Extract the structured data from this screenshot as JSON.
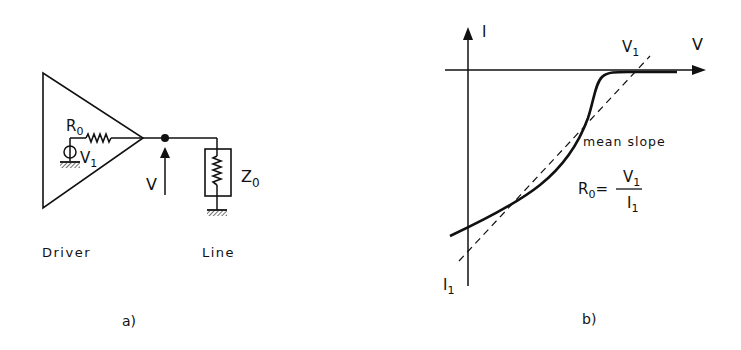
{
  "figure_a": {
    "caption": "a)",
    "driver_label": "Driver",
    "line_label": "Line",
    "resistor_label": "R",
    "resistor_sub": "0",
    "source_label": "V",
    "source_sub": "1",
    "voltage_label": "V",
    "impedance_label": "Z",
    "impedance_sub": "0"
  },
  "figure_b": {
    "caption": "b)",
    "y_axis_label": "I",
    "x_axis_label": "V",
    "v1_label": "V",
    "v1_sub": "1",
    "i1_label": "I",
    "i1_sub": "1",
    "annotation": "mean slope",
    "formula_lhs": "R",
    "formula_lhs_sub": "0",
    "formula_eq": "=",
    "formula_num": "V",
    "formula_num_sub": "1",
    "formula_den": "I",
    "formula_den_sub": "1"
  },
  "colors": {
    "ink": "#111111",
    "background": "#ffffff"
  }
}
